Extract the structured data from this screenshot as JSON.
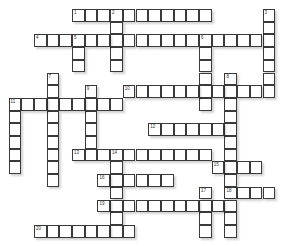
{
  "puzzle": {
    "type": "crossword",
    "entries": [
      {
        "number": "1",
        "direction": "across",
        "row": 0,
        "col": 5,
        "length": 11
      },
      {
        "number": "2",
        "direction": "down",
        "row": 0,
        "col": 8,
        "length": 5
      },
      {
        "number": "3",
        "direction": "down",
        "row": 0,
        "col": 20,
        "length": 7
      },
      {
        "number": "4",
        "direction": "across",
        "row": 2,
        "col": 2,
        "length": 18
      },
      {
        "number": "5",
        "direction": "down",
        "row": 2,
        "col": 5,
        "length": 3
      },
      {
        "number": "6",
        "direction": "down",
        "row": 2,
        "col": 15,
        "length": 6
      },
      {
        "number": "7",
        "direction": "down",
        "row": 5,
        "col": 3,
        "length": 9
      },
      {
        "number": "8",
        "direction": "down",
        "row": 5,
        "col": 17,
        "length": 13
      },
      {
        "number": "9",
        "direction": "down",
        "row": 6,
        "col": 6,
        "length": 5
      },
      {
        "number": "10",
        "direction": "across",
        "row": 6,
        "col": 9,
        "length": 12
      },
      {
        "number": "11",
        "direction": "across",
        "row": 7,
        "col": 0,
        "length": 9
      },
      {
        "number": "",
        "direction": "down",
        "row": 7,
        "col": 0,
        "length": 6
      },
      {
        "number": "12",
        "direction": "across",
        "row": 9,
        "col": 11,
        "length": 7
      },
      {
        "number": "13",
        "direction": "across",
        "row": 11,
        "col": 5,
        "length": 11
      },
      {
        "number": "14",
        "direction": "down",
        "row": 11,
        "col": 8,
        "length": 7
      },
      {
        "number": "15",
        "direction": "across",
        "row": 12,
        "col": 16,
        "length": 4
      },
      {
        "number": "16",
        "direction": "across",
        "row": 13,
        "col": 7,
        "length": 6
      },
      {
        "number": "17",
        "direction": "down",
        "row": 14,
        "col": 15,
        "length": 4
      },
      {
        "number": "18",
        "direction": "across",
        "row": 14,
        "col": 17,
        "length": 4
      },
      {
        "number": "19",
        "direction": "across",
        "row": 15,
        "col": 7,
        "length": 10
      },
      {
        "number": "20",
        "direction": "across",
        "row": 17,
        "col": 2,
        "length": 8
      }
    ]
  }
}
